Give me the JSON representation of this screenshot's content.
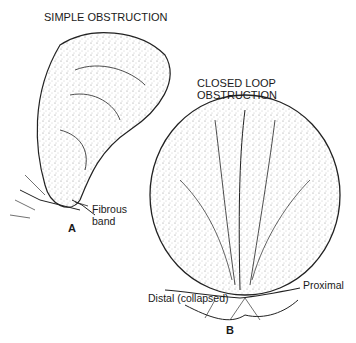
{
  "figure": {
    "panel_a": {
      "title": "SIMPLE OBSTRUCTION",
      "letter": "A",
      "annotations": [
        "Fibrous",
        "band"
      ]
    },
    "panel_b": {
      "title_line1": "CLOSED LOOP",
      "title_line2": "OBSTRUCTION",
      "letter": "B",
      "annotations": {
        "distal": "Distal (collapsed)",
        "proximal": "Proximal"
      }
    },
    "colors": {
      "ink": "#1a1a1a",
      "background": "#ffffff",
      "stipple": "#888888"
    }
  }
}
